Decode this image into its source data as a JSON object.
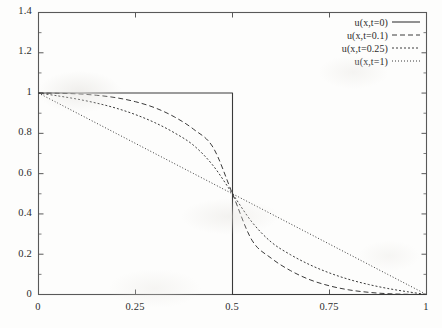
{
  "chart_data": {
    "type": "line",
    "title": "",
    "subtitle": "",
    "xlabel": "",
    "ylabel": "",
    "xlim": [
      0,
      1
    ],
    "ylim": [
      0,
      1.4
    ],
    "grid": false,
    "legend_position": "top-right inside",
    "xticks": [
      "0",
      "0.25",
      "0.5",
      "0.75",
      "1"
    ],
    "xtick_values": [
      0,
      0.25,
      0.5,
      0.75,
      1
    ],
    "yticks": [
      "0",
      "0.2",
      "0.4",
      "0.6",
      "0.8",
      "1",
      "1.2",
      "1.4"
    ],
    "ytick_values": [
      0,
      0.2,
      0.4,
      0.6,
      0.8,
      1,
      1.2,
      1.4
    ],
    "ytick_minor_values": [
      0.1,
      0.3,
      0.5,
      0.7,
      0.9,
      1.1,
      1.3
    ],
    "line_color": "#3a3a3a",
    "frame_color": "#595959",
    "background": "#fdfdfc",
    "series": [
      {
        "name": "u(x,t=0)",
        "style": "solid",
        "x": [
          0,
          0.1,
          0.2,
          0.3,
          0.4,
          0.45,
          0.5,
          0.5,
          0.55,
          0.6,
          0.7,
          0.8,
          0.9,
          1
        ],
        "values": [
          1,
          1,
          1,
          1,
          1,
          1,
          1,
          0,
          0,
          0,
          0,
          0,
          0,
          0
        ]
      },
      {
        "name": "u(x,t=0.1)",
        "style": "dashed",
        "x": [
          0,
          0.05,
          0.1,
          0.15,
          0.2,
          0.25,
          0.3,
          0.35,
          0.4,
          0.45,
          0.5,
          0.55,
          0.6,
          0.65,
          0.7,
          0.75,
          0.8,
          0.85,
          0.9,
          0.95,
          1
        ],
        "values": [
          1,
          0.999,
          0.996,
          0.989,
          0.977,
          0.957,
          0.927,
          0.882,
          0.82,
          0.73,
          0.5,
          0.27,
          0.18,
          0.118,
          0.073,
          0.043,
          0.023,
          0.011,
          0.004,
          0.001,
          0
        ]
      },
      {
        "name": "u(x,t=0.25)",
        "style": "dotted",
        "x": [
          0,
          0.05,
          0.1,
          0.15,
          0.2,
          0.25,
          0.3,
          0.35,
          0.4,
          0.45,
          0.5,
          0.55,
          0.6,
          0.65,
          0.7,
          0.75,
          0.8,
          0.85,
          0.9,
          0.95,
          1
        ],
        "values": [
          1,
          0.986,
          0.97,
          0.95,
          0.925,
          0.893,
          0.853,
          0.803,
          0.74,
          0.64,
          0.5,
          0.36,
          0.26,
          0.197,
          0.147,
          0.107,
          0.075,
          0.05,
          0.03,
          0.014,
          0
        ]
      },
      {
        "name": "u(x,t=1)",
        "style": "fine-dotted",
        "x": [
          0,
          0.05,
          0.1,
          0.15,
          0.2,
          0.25,
          0.3,
          0.35,
          0.4,
          0.45,
          0.5,
          0.55,
          0.6,
          0.65,
          0.7,
          0.75,
          0.8,
          0.85,
          0.9,
          0.95,
          1
        ],
        "values": [
          1,
          0.95,
          0.9,
          0.85,
          0.8,
          0.75,
          0.7,
          0.65,
          0.6,
          0.55,
          0.5,
          0.45,
          0.4,
          0.35,
          0.3,
          0.25,
          0.2,
          0.15,
          0.1,
          0.05,
          0
        ]
      }
    ]
  }
}
